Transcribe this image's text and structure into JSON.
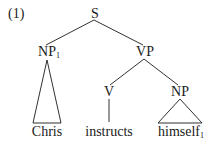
{
  "example_number": "(1)",
  "tree": {
    "root": {
      "label": "S"
    },
    "subject": {
      "label": "NP",
      "index": "1",
      "word": "Chris",
      "abbreviated": true
    },
    "predicate": {
      "label": "VP"
    },
    "verb": {
      "label": "V",
      "word": "instructs"
    },
    "object": {
      "label": "NP",
      "word": "himself",
      "index": "1",
      "abbreviated": true
    }
  },
  "colors": {
    "ink": "#1a1a1a",
    "background": "#ffffff"
  }
}
